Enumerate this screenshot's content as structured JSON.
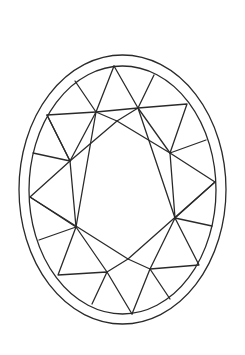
{
  "diagram": {
    "title": "Oval brilliant cut gemstone facet diagram",
    "stroke_color": "#2a2a2a",
    "background": "#ffffff",
    "stroke_width": 1.3,
    "outer_ellipse": {
      "cx": 122.5,
      "cy": 189.5,
      "rx": 103.5,
      "ry": 134.5
    },
    "inner_ellipse": {
      "cx": 122.5,
      "cy": 190,
      "rx": 93.5,
      "ry": 124
    },
    "rim_points": {
      "top": [
        114,
        66
      ],
      "tr1": [
        154,
        75
      ],
      "tl1": [
        75,
        81
      ],
      "tr2": [
        187,
        104
      ],
      "tl2": [
        47,
        115
      ],
      "tr3": [
        206,
        140
      ],
      "tl3": [
        33,
        153
      ],
      "r": [
        215,
        182
      ],
      "l": [
        30,
        197
      ],
      "br3": [
        212,
        226
      ],
      "bl3": [
        39,
        240
      ],
      "br2": [
        199,
        265
      ],
      "bl2": [
        58,
        275
      ],
      "br1": [
        170,
        299
      ],
      "bl1": [
        92,
        304
      ],
      "bottom": [
        132,
        314
      ]
    },
    "inner_points": {
      "a": [
        96,
        112
      ],
      "b": [
        138,
        108
      ],
      "c": [
        70,
        161
      ],
      "d": [
        170,
        153
      ],
      "e": [
        76,
        227
      ],
      "f": [
        175,
        218
      ],
      "g": [
        107,
        272
      ],
      "h": [
        150,
        269
      ],
      "t": [
        117,
        121
      ],
      "u": [
        128,
        259
      ]
    }
  }
}
